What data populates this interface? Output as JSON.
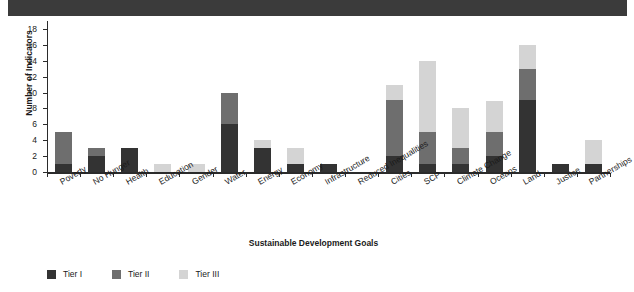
{
  "header": {
    "text": ""
  },
  "legend": {
    "position": "bottom-left",
    "items": [
      {
        "label": "Tier I",
        "color": "#333333"
      },
      {
        "label": "Tier II",
        "color": "#6e6e6e"
      },
      {
        "label": "Tier III",
        "color": "#d4d4d4"
      }
    ]
  },
  "chart_data": {
    "type": "bar",
    "subtype": "stacked",
    "title": "",
    "xlabel": "Sustainable Development Goals",
    "ylabel": "Number of Indicators",
    "ylim": [
      0,
      19
    ],
    "yticks": [
      0,
      2,
      4,
      6,
      8,
      10,
      12,
      14,
      16,
      18
    ],
    "grid": false,
    "categories": [
      "Poverty",
      "No Hunger",
      "Health",
      "Education",
      "Gender",
      "Water",
      "Energy",
      "Economy",
      "Infrastructure",
      "Reduced Inequalities",
      "Cities",
      "SCP",
      "Climate Change",
      "Oceans",
      "Land",
      "Justice",
      "Partnerships"
    ],
    "series": [
      {
        "name": "Tier I",
        "color": "#333333",
        "values": [
          1,
          2,
          3,
          0,
          0,
          6,
          3,
          1,
          1,
          0,
          2,
          1,
          1,
          2,
          9,
          1,
          1
        ]
      },
      {
        "name": "Tier II",
        "color": "#6e6e6e",
        "values": [
          4,
          1,
          0,
          0,
          0,
          4,
          0,
          0,
          0,
          0,
          7,
          4,
          2,
          3,
          4,
          0,
          0
        ]
      },
      {
        "name": "Tier III",
        "color": "#d4d4d4",
        "values": [
          0,
          0,
          0,
          1,
          1,
          0,
          1,
          2,
          0,
          0,
          2,
          9,
          5,
          4,
          3,
          0,
          3
        ]
      }
    ],
    "totals": [
      5,
      3,
      3,
      1,
      1,
      10,
      4,
      3,
      1,
      0,
      11,
      14,
      8,
      9,
      16,
      1,
      4
    ]
  }
}
